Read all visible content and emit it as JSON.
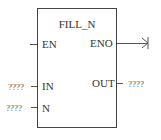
{
  "block": {
    "title": "FILL_N",
    "inputs": {
      "en": {
        "label": "EN"
      },
      "in": {
        "label": "IN",
        "operand": "????"
      },
      "n": {
        "label": "N",
        "operand": "????"
      }
    },
    "outputs": {
      "eno": {
        "label": "ENO"
      },
      "out": {
        "label": "OUT",
        "operand": "????"
      }
    }
  }
}
